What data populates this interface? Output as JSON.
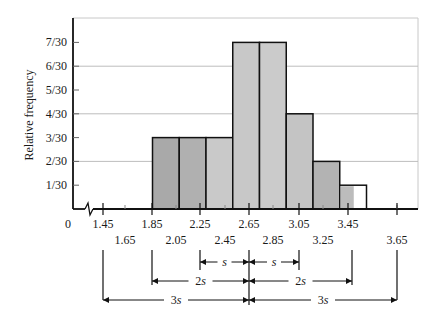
{
  "chart_data": {
    "type": "bar",
    "title": "",
    "xlabel": "",
    "ylabel": "Relative frequency",
    "bin_edges": [
      1.85,
      2.05,
      2.25,
      2.45,
      2.65,
      2.85,
      3.05,
      3.25,
      3.45
    ],
    "categories": [
      "1.85-2.05",
      "2.05-2.25",
      "2.25-2.45",
      "2.45-2.65",
      "2.65-2.85",
      "2.85-3.05",
      "3.05-3.25",
      "3.25-3.45"
    ],
    "values": [
      3,
      3,
      3,
      7,
      7,
      4,
      2,
      1
    ],
    "value_labels": [
      "3/30",
      "3/30",
      "3/30",
      "7/30",
      "7/30",
      "4/30",
      "2/30",
      "1/30"
    ],
    "y_ticks": [
      "1/30",
      "2/30",
      "3/30",
      "4/30",
      "5/30",
      "6/30",
      "7/30"
    ],
    "x_ticks_upper": [
      "0",
      "1.45",
      "1.85",
      "2.25",
      "2.65",
      "3.05",
      "3.45"
    ],
    "x_ticks_lower": [
      "1.65",
      "2.05",
      "2.45",
      "2.85",
      "3.25",
      "3.65"
    ],
    "ylim": [
      0,
      8
    ],
    "grid": "horizontal at even multiples of 1/30",
    "axis_break": true,
    "annotations": {
      "center": 2.65,
      "intervals": [
        {
          "label": "s",
          "from": 2.25,
          "to": 3.05
        },
        {
          "label": "2s",
          "from": 1.85,
          "to": 3.45
        },
        {
          "label": "3s",
          "from": 1.45,
          "to": 3.85
        }
      ]
    }
  },
  "labels": {
    "ylabel": "Relative frequency",
    "s": "s",
    "two_s": "2s",
    "three_s": "3s"
  }
}
